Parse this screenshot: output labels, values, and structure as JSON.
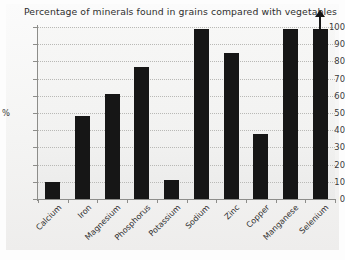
{
  "chart_data": {
    "type": "bar",
    "title": "Percentage of minerals found in grains compared with vegetables",
    "xlabel": "",
    "ylabel": "%",
    "ylim": [
      0,
      100
    ],
    "ytick_step": 10,
    "yticks": [
      "100",
      "90",
      "80",
      "70",
      "60",
      "50",
      "40",
      "30",
      "20",
      "10",
      "0"
    ],
    "grid": "horizontal-dotted",
    "legend": "none",
    "categories": [
      "Calcium",
      "Iron",
      "Magnesium",
      "Phosphorus",
      "Potassium",
      "Sodium",
      "Zinc",
      "Copper",
      "Manganese",
      "Selenium"
    ],
    "values": [
      10,
      48,
      61,
      77,
      11,
      99,
      85,
      38,
      99,
      99
    ],
    "annotations": [
      {
        "name": "selenium-overflow-arrow",
        "category": "Selenium",
        "symbol": "up-arrow",
        "meaning": "value extends above axis maximum"
      }
    ]
  },
  "figure": {
    "bar_color": "#161616",
    "grid_color": "#b9b9b6",
    "axis_color": "#8d8d8a",
    "plot_background": "#f2f2f1"
  }
}
